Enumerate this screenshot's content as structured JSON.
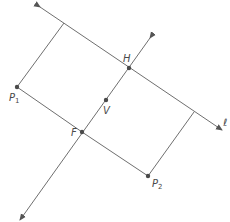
{
  "diagram": {
    "points": {
      "P1": {
        "label": "P",
        "sub": "1",
        "x": 17,
        "y": 87
      },
      "P2": {
        "label": "P",
        "sub": "2",
        "x": 148,
        "y": 176
      },
      "H": {
        "label": "H",
        "x": 129,
        "y": 68
      },
      "V": {
        "label": "V",
        "x": 106,
        "y": 100
      },
      "F": {
        "label": "F",
        "x": 82,
        "y": 132
      }
    },
    "line_label": "ℓ",
    "colors": {
      "stroke": "#6f6f6f",
      "point": "#4a4a4a"
    }
  }
}
